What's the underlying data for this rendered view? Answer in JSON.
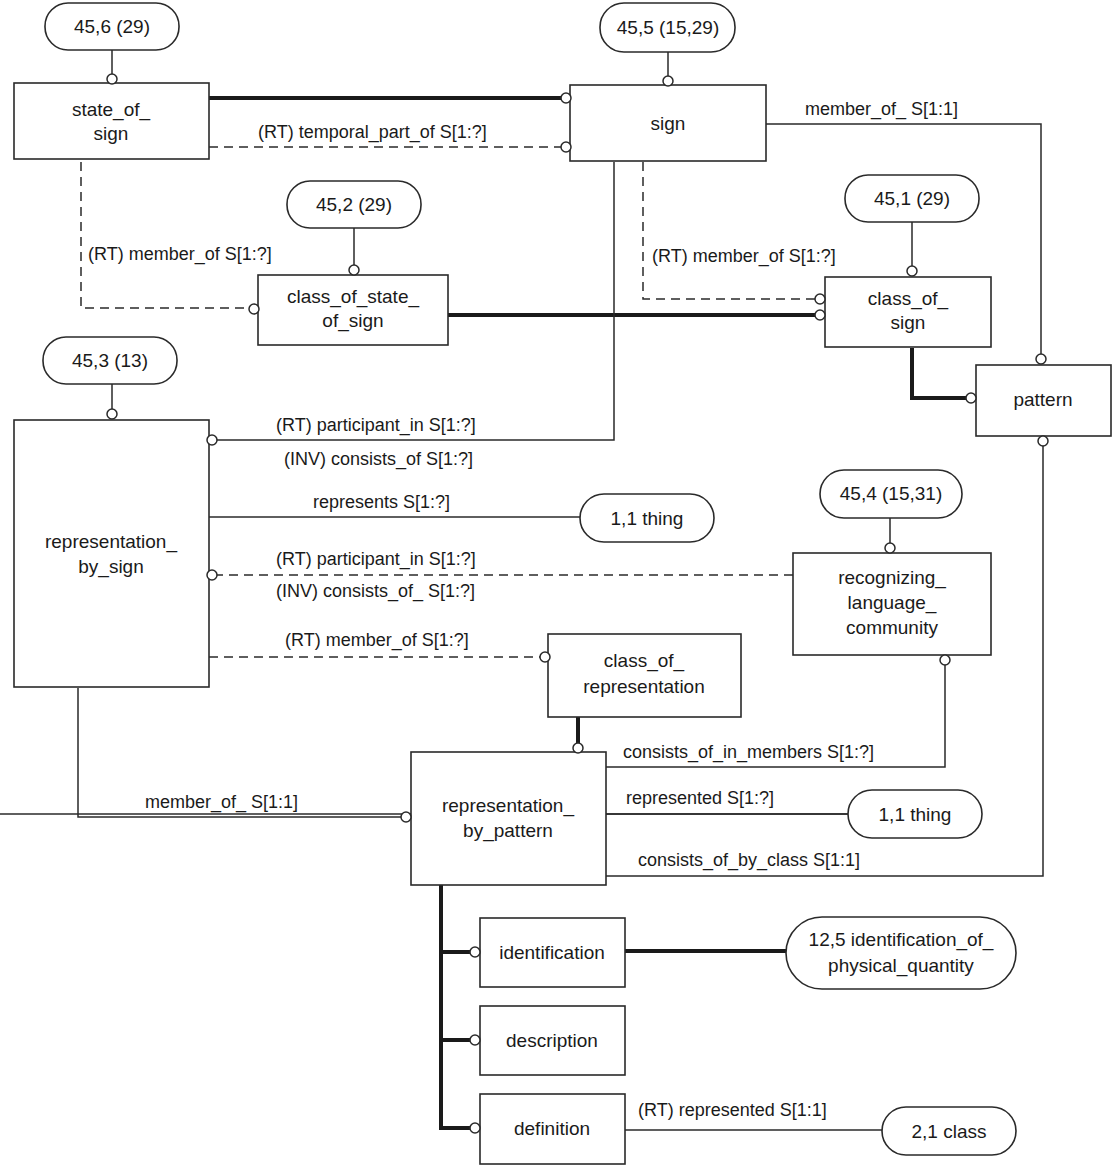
{
  "diagram": {
    "type": "EXPRESS-G schema diagram",
    "entities": {
      "state_of_sign": [
        "state_of_",
        "sign"
      ],
      "sign": [
        "sign"
      ],
      "class_of_state_of_sign": [
        "class_of_state_",
        "of_sign"
      ],
      "class_of_sign": [
        "class_of_",
        "sign"
      ],
      "pattern": [
        "pattern"
      ],
      "representation_by_sign": [
        "representation_",
        "by_sign"
      ],
      "recognizing_language_community": [
        "recognizing_",
        "language_",
        "community"
      ],
      "class_of_representation": [
        "class_of_",
        "representation"
      ],
      "representation_by_pattern": [
        "representation_",
        "by_pattern"
      ],
      "identification": [
        "identification"
      ],
      "description": [
        "description"
      ],
      "definition": [
        "definition"
      ]
    },
    "page_refs": {
      "ref_45_6": [
        "45,6 (29)"
      ],
      "ref_45_5": [
        "45,5 (15,29)"
      ],
      "ref_45_2": [
        "45,2 (29)"
      ],
      "ref_45_1": [
        "45,1 (29)"
      ],
      "ref_45_3": [
        "45,3 (13)"
      ],
      "ref_45_4": [
        "45,4 (15,31)"
      ],
      "ref_thing_1": [
        "1,1 thing"
      ],
      "ref_thing_2": [
        "1,1 thing"
      ],
      "ref_12_5": [
        "12,5 identification_of_",
        "physical_quantity"
      ],
      "ref_2_1": [
        "2,1 class"
      ]
    },
    "relationships": {
      "temporal_part_of": "(RT) temporal_part_of S[1:?]",
      "sign_member_of": "member_of_ S[1:1]",
      "state_member_of": "(RT) member_of S[1:?]",
      "sign_class_member_of": "(RT) member_of S[1:?]",
      "participant_in_1": "(RT) participant_in S[1:?]",
      "consists_of_1": "(INV) consists_of S[1:?]",
      "represents": "represents S[1:?]",
      "participant_in_2": "(RT) participant_in S[1:?]",
      "consists_of_2": "(INV) consists_of_ S[1:?]",
      "rep_member_of": "(RT) member_of S[1:?]",
      "consists_of_in_members": "consists_of_in_members S[1:?]",
      "pattern_member_of": "member_of_ S[1:1]",
      "represented": "represented S[1:?]",
      "consists_of_by_class": "consists_of_by_class S[1:1]",
      "rt_represented": "(RT) represented S[1:1]"
    }
  }
}
